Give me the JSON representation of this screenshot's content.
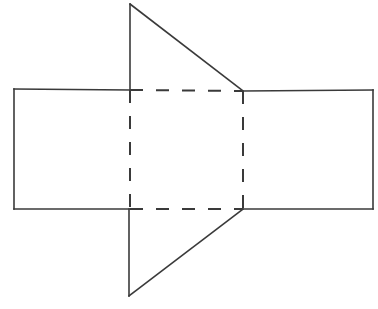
{
  "figure": {
    "canvas": {
      "width": 378,
      "height": 309
    },
    "background_color": "#ffffff",
    "line_color": "#3a3a3a",
    "solid_stroke_width": 1.6,
    "hidden_stroke_width": 2.0,
    "dash_pattern": "13 13",
    "points": {
      "rect_top_left": {
        "x": 14,
        "y": 89
      },
      "rect_top_right": {
        "x": 373,
        "y": 90
      },
      "rect_bottom_right": {
        "x": 373,
        "y": 209
      },
      "rect_bottom_left": {
        "x": 14,
        "y": 209
      },
      "square_top_left": {
        "x": 130,
        "y": 90
      },
      "square_top_right": {
        "x": 243,
        "y": 91
      },
      "square_bottom_right": {
        "x": 243,
        "y": 209
      },
      "square_bottom_left": {
        "x": 130,
        "y": 209
      },
      "top_apex": {
        "x": 130,
        "y": 4
      },
      "bottom_apex": {
        "x": 129,
        "y": 296
      }
    },
    "edges": {
      "rect_top_left_segment": "M 14 89 L 130 90",
      "rect_top_right_segment": "M 243 91 L 373 90",
      "rect_bottom_left_segment": "M 14 209 L 130 209",
      "rect_bottom_right_segment": "M 243 209 L 373 209",
      "rect_left_side": "M 14 89 L 14 209",
      "rect_right_side": "M 373 90 L 373 209",
      "top_flap_vertical": "M 130 4 L 130 90",
      "top_flap_diagonal": "M 130 4 L 243 91",
      "bottom_flap_vertical": "M 129 209 L 129 296",
      "bottom_flap_diagonal": "M 129 296 L 243 209",
      "hidden_square_top": "M 130 90 L 243 91",
      "hidden_square_bottom": "M 130 209 L 243 209",
      "hidden_square_left": "M 130 90 L 130 209",
      "hidden_square_right": "M 243 91 L 243 209"
    }
  },
  "chart_data": {
    "type": "diagram",
    "shapes": [
      {
        "name": "outer-rectangle",
        "kind": "rectangle",
        "style": "solid",
        "vertices": [
          [
            14,
            89
          ],
          [
            373,
            90
          ],
          [
            373,
            209
          ],
          [
            14,
            209
          ]
        ]
      },
      {
        "name": "interior-square",
        "kind": "quadrilateral",
        "style": "dashed",
        "vertices": [
          [
            130,
            90
          ],
          [
            243,
            91
          ],
          [
            243,
            209
          ],
          [
            130,
            209
          ]
        ]
      },
      {
        "name": "upper-triangle-flap",
        "kind": "triangle",
        "style": "solid",
        "vertices": [
          [
            130,
            4
          ],
          [
            243,
            91
          ],
          [
            130,
            90
          ]
        ]
      },
      {
        "name": "lower-triangle-flap",
        "kind": "triangle",
        "style": "solid",
        "vertices": [
          [
            129,
            296
          ],
          [
            243,
            209
          ],
          [
            129,
            209
          ]
        ]
      }
    ],
    "xlim": [
      0,
      378
    ],
    "ylim": [
      0,
      309
    ],
    "grid": false,
    "legend": null
  }
}
